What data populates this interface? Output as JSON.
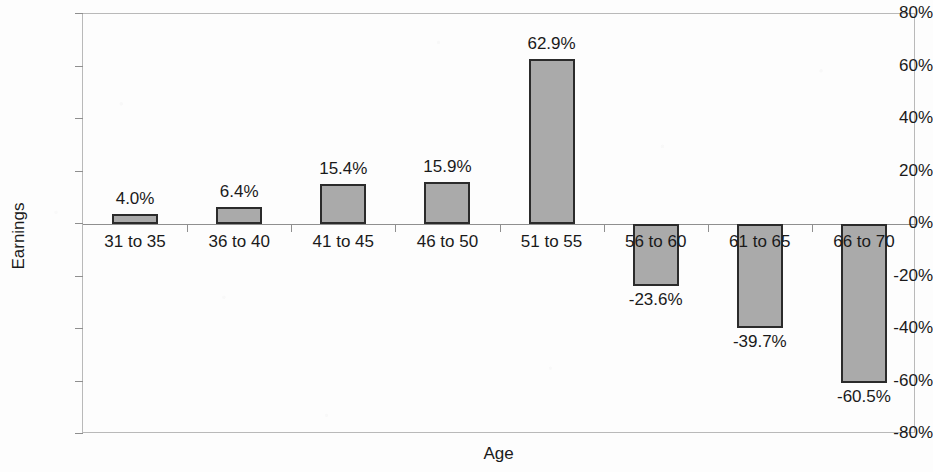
{
  "chart_data": {
    "type": "bar",
    "title": "",
    "xlabel": "Age",
    "ylabel": "Earnings",
    "categories": [
      "31 to 35",
      "36 to 40",
      "41 to 45",
      "46 to 50",
      "51 to 55",
      "56 to 60",
      "61 to 65",
      "66 to 70"
    ],
    "values": [
      4.0,
      6.4,
      15.4,
      15.9,
      62.9,
      -23.6,
      -39.7,
      -60.5
    ],
    "data_labels": [
      "4.0%",
      "6.4%",
      "15.4%",
      "15.9%",
      "62.9%",
      "-23.6%",
      "-39.7%",
      "-60.5%"
    ],
    "ylim": [
      -80,
      80
    ],
    "ytick_values": [
      80,
      60,
      40,
      20,
      0,
      -20,
      -40,
      -60,
      -80
    ],
    "ytick_labels": [
      "80%",
      "60%",
      "40%",
      "20%",
      "0%",
      "-20%",
      "-40%",
      "-60%",
      "-80%"
    ],
    "grid": false,
    "legend": false,
    "bar_fill_color": "#aaaaaa",
    "bar_border_color": "#2b2b2b",
    "axis_color": "#8f8f8f",
    "plot_border_color": "#b9b9b9",
    "background_color": "#fdfdfd"
  }
}
